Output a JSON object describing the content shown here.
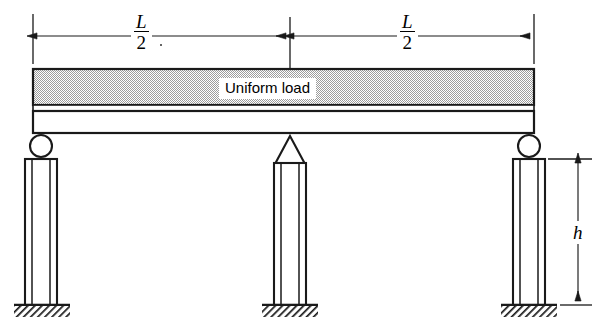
{
  "figure": {
    "kind": "structural-beam-diagram"
  },
  "dimensions": {
    "span_left": {
      "numerator": "L",
      "denominator": "2",
      "label": "L/2"
    },
    "span_right": {
      "numerator": "L",
      "denominator": "2",
      "label": "L/2"
    },
    "column_height": {
      "label": "h"
    }
  },
  "beam": {
    "load_label": "Uniform load",
    "load_band_fill": "#c9c9c9",
    "web_band_fill": "#ffffff",
    "outline_color": "#1a1a1a"
  },
  "supports": [
    {
      "id": "left",
      "type": "roller-support",
      "icon": "circle-roller-icon"
    },
    {
      "id": "center",
      "type": "pin-support",
      "icon": "triangle-pin-icon"
    },
    {
      "id": "right",
      "type": "roller-support",
      "icon": "circle-roller-icon"
    }
  ],
  "foundations": [
    {
      "id": "left",
      "icon": "ground-hatch-icon"
    },
    {
      "id": "center",
      "icon": "ground-hatch-icon"
    },
    {
      "id": "right",
      "icon": "ground-hatch-icon"
    }
  ],
  "colors": {
    "ink": "#1a1a1a",
    "load_gray": "#c9c9c9",
    "paper": "#ffffff"
  }
}
